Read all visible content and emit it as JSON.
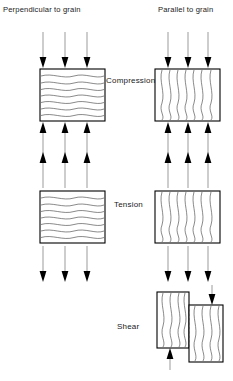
{
  "diagram": {
    "title_absent": true,
    "columns": [
      {
        "key": "perpendicular",
        "label": "Perpendicular to grain",
        "grain_direction": "horizontal"
      },
      {
        "key": "parallel",
        "label": "Parallel to grain",
        "grain_direction": "vertical"
      }
    ],
    "rows": [
      {
        "key": "compression",
        "label": "Compression",
        "arrow_direction": "inward",
        "arrows_per_edge": 3,
        "edges": [
          "top",
          "bottom"
        ],
        "has_left_figure": true,
        "has_right_figure": true
      },
      {
        "key": "tension",
        "label": "Tension",
        "arrow_direction": "outward",
        "arrows_per_edge": 3,
        "edges": [
          "top",
          "bottom"
        ],
        "has_left_figure": true,
        "has_right_figure": true
      },
      {
        "key": "shear",
        "label": "Shear",
        "arrow_direction": "opposed",
        "arrows_per_edge": 1,
        "edges": [
          "top",
          "bottom"
        ],
        "has_left_figure": false,
        "has_right_figure": true,
        "figure_note": "two offset blocks with vertical grain separated by a dashed shear plane"
      }
    ],
    "colors": {
      "block_outline": "#000000",
      "grain_line": "#3a3a3a",
      "arrow_shaft": "#8a8a8a",
      "arrow_head": "#000000",
      "background": "#ffffff",
      "text": "#1a1a1a"
    }
  }
}
